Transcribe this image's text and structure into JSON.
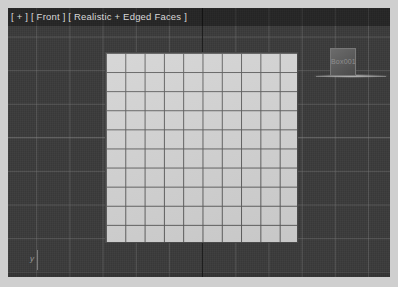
{
  "app": {
    "title": "3D Viewport",
    "background_color": "#cfcfcf"
  },
  "viewport": {
    "label": "[ + ] [ Front ] [ Realistic + Edged Faces ]",
    "label_parts": {
      "maximize_toggle": "[ + ]",
      "view_name": "[ Front ]",
      "shading_mode": "[ Realistic + Edged Faces ]"
    },
    "background_color": "#3a3a3a",
    "grid_line_color": "#787878",
    "grid_spacing_px": 33,
    "world_axis_color": "#141414"
  },
  "objects": {
    "plane": {
      "name": "Plane001",
      "fill_color": "#d2d2d2",
      "edge_color": "#585858",
      "segments_x": 10,
      "segments_y": 10,
      "selected": false
    },
    "box": {
      "name": "Box001",
      "label": "Box001",
      "fill_color": "#5b5b5b",
      "edge_color": "#787878"
    }
  },
  "gizmo": {
    "axis_label": "y"
  }
}
